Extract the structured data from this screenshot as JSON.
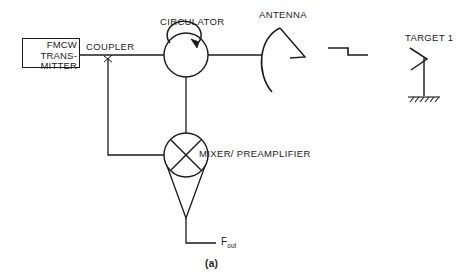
{
  "figure": {
    "caption": "(a)",
    "background_color": "#ffffff",
    "line_color": "#1b1b1b",
    "type": "fmcw-radar-block-diagram"
  },
  "blocks": {
    "transmitter": {
      "label_line_1": "FMCW",
      "label_line_2": "TRANS-",
      "label_line_3": "MITTER",
      "shape": "rectangle"
    },
    "coupler": {
      "label": "COUPLER",
      "marker": "×",
      "shape": "tap-junction"
    },
    "circulator": {
      "label": "CIRCULATOR",
      "shape": "circle-with-clockwise-arrow"
    },
    "antenna": {
      "label": "ANTENNA",
      "shape": "parabolic-dish-with-feed"
    },
    "mixer": {
      "label": "MIXER/ PREAMPLIFIER",
      "shape": "circle-with-x-and-triangle-amplifier"
    },
    "target": {
      "label": "TARGET 1",
      "shape": "antenna-mast-on-hatched-ground"
    }
  },
  "signals": {
    "output": "F",
    "output_subscript": "out",
    "propagation_symbol": "step-wave"
  }
}
